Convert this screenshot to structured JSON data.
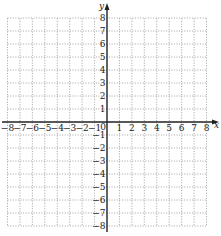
{
  "diagram": {
    "type": "coordinate-plane",
    "x_axis": {
      "label": "x",
      "min": -8,
      "max": 8,
      "tick_labels": [
        "-8",
        "-7",
        "-6",
        "-5",
        "-4",
        "-3",
        "-2",
        "-1",
        "1",
        "2",
        "3",
        "4",
        "5",
        "6",
        "7",
        "8"
      ]
    },
    "y_axis": {
      "label": "y",
      "min": -8,
      "max": 8,
      "tick_labels": [
        "8",
        "7",
        "6",
        "5",
        "4",
        "3",
        "2",
        "1",
        "-1",
        "-2",
        "-3",
        "-4",
        "-5",
        "-6",
        "-7",
        "-8"
      ]
    },
    "origin_label": "0",
    "grid": {
      "style": "dotted",
      "spacing": 1
    },
    "colors": {
      "axis": "#222222",
      "grid": "#8a8a8a",
      "background": "#ffffff"
    }
  }
}
